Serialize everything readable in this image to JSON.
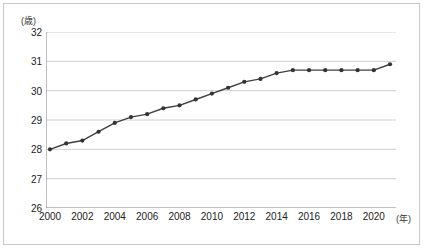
{
  "chart_data": {
    "type": "line",
    "title": "",
    "subtitle": "",
    "xlabel": "(年)",
    "ylabel": "(歳)",
    "y_unit_label": "(歳)",
    "x_unit_label": "(年)",
    "grid": true,
    "legend": "none",
    "ylim": [
      26,
      32
    ],
    "xlim": [
      2000,
      2021
    ],
    "y_ticks": [
      32,
      31,
      30,
      29,
      28,
      27,
      26
    ],
    "x_ticks": [
      2000,
      2002,
      2004,
      2006,
      2008,
      2010,
      2012,
      2014,
      2016,
      2018,
      2020
    ],
    "x": [
      2000,
      2001,
      2002,
      2003,
      2004,
      2005,
      2006,
      2007,
      2008,
      2009,
      2010,
      2011,
      2012,
      2013,
      2014,
      2015,
      2016,
      2017,
      2018,
      2019,
      2020,
      2021
    ],
    "values": [
      28.0,
      28.2,
      28.3,
      28.6,
      28.9,
      29.1,
      29.2,
      29.4,
      29.5,
      29.7,
      29.9,
      30.1,
      30.3,
      30.4,
      30.6,
      30.7,
      30.7,
      30.7,
      30.7,
      30.7,
      30.7,
      30.9
    ],
    "series": [
      {
        "name": "平均年齢",
        "values": [
          28.0,
          28.2,
          28.3,
          28.6,
          28.9,
          29.1,
          29.2,
          29.4,
          29.5,
          29.7,
          29.9,
          30.1,
          30.3,
          30.4,
          30.6,
          30.7,
          30.7,
          30.7,
          30.7,
          30.7,
          30.7,
          30.9
        ]
      }
    ],
    "colors": {
      "line": "#404040",
      "marker": "#333333",
      "grid": "#cfcfcf",
      "axis": "#808080",
      "frame": "#c8c8c8",
      "background": "#ffffff"
    },
    "marker": "circle",
    "annotations": []
  }
}
